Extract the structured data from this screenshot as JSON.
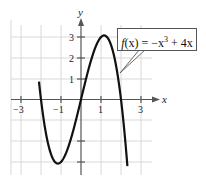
{
  "chart_data": {
    "type": "line",
    "title": "",
    "xlabel": "x",
    "ylabel": "y",
    "xlim": [
      -3.5,
      3.5
    ],
    "ylim": [
      -3.6,
      3.6
    ],
    "grid": true,
    "x_ticks": [
      "-3",
      "-1",
      "1",
      "3"
    ],
    "y_ticks": [
      "1",
      "2",
      "3"
    ],
    "series": [
      {
        "name": "f(x) = -x^3 + 4x",
        "x": [
          -2.4,
          -2,
          -1.5,
          -1.155,
          -0.5,
          0,
          0.5,
          1.155,
          1.5,
          2,
          2.35
        ],
        "y": [
          4.22,
          0,
          -2.63,
          -3.08,
          -1.88,
          0,
          1.88,
          3.08,
          2.63,
          0,
          -3.58
        ]
      }
    ],
    "annotations": [
      {
        "text_prefix": "f",
        "text_arg": "(x) = −x",
        "text_exp": "3",
        "text_suffix": " + 4x"
      }
    ]
  },
  "labels": {
    "x_axis": "x",
    "y_axis": "y",
    "xt": [
      "−3",
      "−1",
      "1",
      "3"
    ],
    "yt": [
      "3",
      "2",
      "1"
    ]
  }
}
